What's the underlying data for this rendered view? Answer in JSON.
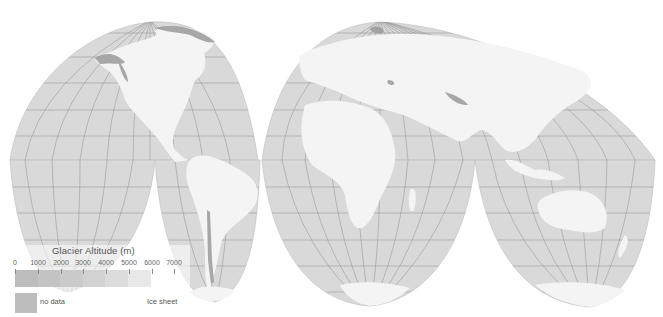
{
  "map": {
    "projection": "interrupted goode homolosine",
    "colors": {
      "ocean": "#d9d9d9",
      "land": "#f4f4f4",
      "graticule": "#8e8e8e",
      "glacier": "#9a9a9a",
      "background": "#ffffff"
    }
  },
  "legend": {
    "title": "Glacier Altitude (m)",
    "tick_labels": [
      "0",
      "1000",
      "2000",
      "3000",
      "4000",
      "5000",
      "6000",
      "7000"
    ],
    "bar_colors": [
      "#bcbcbc",
      "#c4c4c4",
      "#cacaca",
      "#d2d2d2",
      "#dcdcdc",
      "#e8e8e8",
      "#f2f2f2"
    ],
    "no_data_label": "no data",
    "no_data_color": "#bdbdbd",
    "ice_sheet_label": "Ice sheet"
  }
}
